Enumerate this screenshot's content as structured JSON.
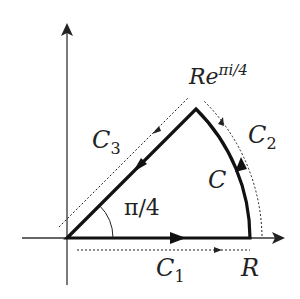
{
  "diagram": {
    "labels": {
      "C1": "C",
      "C1_sub": "1",
      "C2": "C",
      "C2_sub": "2",
      "C3": "C",
      "C3_sub": "3",
      "C": "C",
      "R": "R",
      "corner_base": "Re",
      "corner_exp": "πi/4",
      "angle": "π/4"
    },
    "colors": {
      "contour": "#111111",
      "axes": "#333333",
      "dotted": "#222222"
    }
  }
}
